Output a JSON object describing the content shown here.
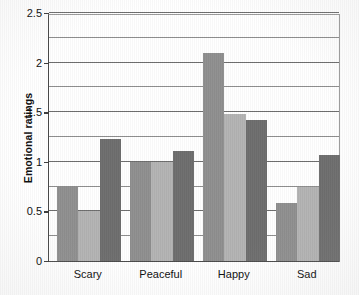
{
  "chart_data": {
    "type": "bar",
    "title": "",
    "xlabel": "",
    "ylabel": "Emotional ratings",
    "categories": [
      "Scary",
      "Peaceful",
      "Happy",
      "Sad"
    ],
    "series": [
      {
        "name": "series-1",
        "color": "#8f8f8f",
        "values": [
          0.75,
          1.0,
          2.1,
          0.58
        ]
      },
      {
        "name": "series-2",
        "color": "#b3b3b3",
        "values": [
          0.5,
          1.0,
          1.48,
          0.75
        ]
      },
      {
        "name": "series-3",
        "color": "#6e6e6e",
        "values": [
          1.23,
          1.11,
          1.42,
          1.07
        ]
      }
    ],
    "ylim": [
      0,
      2.5
    ],
    "ytick_labels": [
      "0",
      "0.5",
      "1",
      "1.5",
      "2",
      "2.5"
    ],
    "ytick_values": [
      0,
      0.5,
      1,
      1.5,
      2,
      2.5
    ],
    "minor_gridline_values": [
      0.25,
      0.75,
      1.25,
      1.75,
      2.25
    ],
    "grid": true,
    "legend": "none"
  },
  "colors": {
    "axis": "#3c3c3c",
    "gridline": "#8d8d8d",
    "text": "#0d0d0d",
    "background": "#ffffff"
  }
}
